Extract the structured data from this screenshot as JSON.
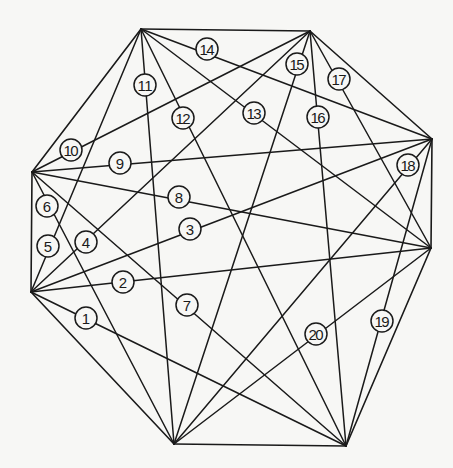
{
  "diagram": {
    "type": "complete-graph-octagon",
    "colors": {
      "line": "#1a1a1a",
      "background": "#f7f7f5"
    },
    "vertices": [
      {
        "id": "A",
        "x": 141,
        "y": 29
      },
      {
        "id": "B",
        "x": 310,
        "y": 31
      },
      {
        "id": "C",
        "x": 432,
        "y": 139
      },
      {
        "id": "D",
        "x": 431,
        "y": 248
      },
      {
        "id": "E",
        "x": 346,
        "y": 446
      },
      {
        "id": "F",
        "x": 174,
        "y": 444
      },
      {
        "id": "G",
        "x": 31,
        "y": 292
      },
      {
        "id": "H",
        "x": 32,
        "y": 172
      }
    ],
    "edges": [
      [
        "A",
        "B"
      ],
      [
        "B",
        "C"
      ],
      [
        "C",
        "D"
      ],
      [
        "D",
        "E"
      ],
      [
        "E",
        "F"
      ],
      [
        "F",
        "G"
      ],
      [
        "G",
        "H"
      ],
      [
        "H",
        "A"
      ]
    ],
    "diagonals": [
      {
        "label": "1",
        "from": "G",
        "to": "E",
        "lx": 86,
        "ly": 318
      },
      {
        "label": "2",
        "from": "G",
        "to": "D",
        "lx": 123,
        "ly": 282
      },
      {
        "label": "3",
        "from": "G",
        "to": "C",
        "lx": 190,
        "ly": 229
      },
      {
        "label": "4",
        "from": "G",
        "to": "B",
        "lx": 86,
        "ly": 242
      },
      {
        "label": "5",
        "from": "G",
        "to": "A",
        "lx": 48,
        "ly": 246
      },
      {
        "label": "6",
        "from": "H",
        "to": "F",
        "lx": 47,
        "ly": 206
      },
      {
        "label": "7",
        "from": "H",
        "to": "E",
        "lx": 187,
        "ly": 305
      },
      {
        "label": "8",
        "from": "H",
        "to": "D",
        "lx": 179,
        "ly": 197
      },
      {
        "label": "9",
        "from": "H",
        "to": "C",
        "lx": 120,
        "ly": 163
      },
      {
        "label": "10",
        "from": "H",
        "to": "B",
        "lx": 71,
        "ly": 150
      },
      {
        "label": "11",
        "from": "A",
        "to": "F",
        "lx": 145,
        "ly": 85
      },
      {
        "label": "12",
        "from": "A",
        "to": "E",
        "lx": 183,
        "ly": 118
      },
      {
        "label": "13",
        "from": "A",
        "to": "D",
        "lx": 254,
        "ly": 113
      },
      {
        "label": "14",
        "from": "A",
        "to": "C",
        "lx": 207,
        "ly": 49
      },
      {
        "label": "15",
        "from": "B",
        "to": "F",
        "lx": 297,
        "ly": 64
      },
      {
        "label": "16",
        "from": "B",
        "to": "E",
        "lx": 318,
        "ly": 117
      },
      {
        "label": "17",
        "from": "B",
        "to": "D",
        "lx": 339,
        "ly": 79
      },
      {
        "label": "18",
        "from": "C",
        "to": "F",
        "lx": 408,
        "ly": 165
      },
      {
        "label": "19",
        "from": "C",
        "to": "E",
        "lx": 382,
        "ly": 321
      },
      {
        "label": "20",
        "from": "D",
        "to": "F",
        "lx": 316,
        "ly": 334
      }
    ]
  }
}
